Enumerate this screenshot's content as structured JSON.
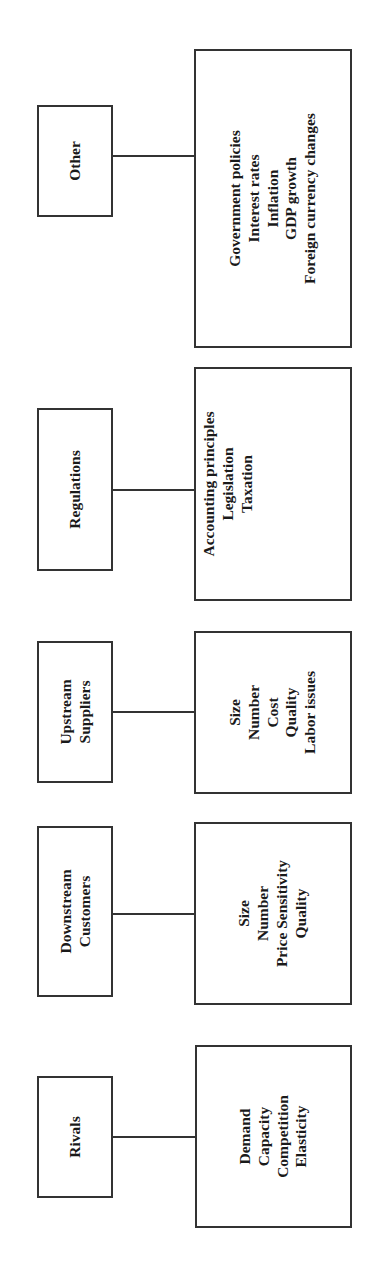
{
  "diagram": {
    "orientation": "rotated-90-ccw",
    "categories": [
      {
        "id": "rivals",
        "title_lines": [
          "Rivals"
        ],
        "factors": [
          "Demand",
          "Capacity",
          "Competition",
          "Elasticity"
        ]
      },
      {
        "id": "downstream-customers",
        "title_lines": [
          "Downstream",
          "Customers"
        ],
        "factors": [
          "Size",
          "Number",
          "Price Sensitivity",
          "Quality"
        ]
      },
      {
        "id": "upstream-suppliers",
        "title_lines": [
          "Upstream",
          "Suppliers"
        ],
        "factors": [
          "Size",
          "Number",
          "Cost",
          "Quality",
          "Labor issues"
        ]
      },
      {
        "id": "regulations",
        "title_lines": [
          "Regulations"
        ],
        "factors": [
          "Accounting principles",
          "Legislation",
          "Taxation"
        ]
      },
      {
        "id": "other",
        "title_lines": [
          "Other"
        ],
        "factors": [
          "Government policies",
          "Interest rates",
          "Inflation",
          "GDP growth",
          "Foreign currency changes"
        ]
      }
    ],
    "colors": {
      "border": "#333333",
      "text": "#1a1a1a",
      "background": "#ffffff"
    }
  }
}
